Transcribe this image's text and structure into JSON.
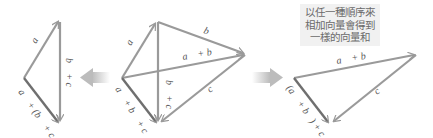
{
  "caption": {
    "lines": [
      "以任一種順序來",
      "相加向量會得到",
      "一樣的向量和"
    ]
  },
  "left_diagram": {
    "labels": {
      "a": "a⃗",
      "b_plus_c": "b⃗ + c⃗",
      "sum": "a⃗ + (b⃗ + c⃗)"
    }
  },
  "center_diagram": {
    "labels": {
      "a": "a⃗",
      "b": "b⃗",
      "a_plus_b": "a⃗ + b⃗",
      "b_plus_c": "b⃗ + c⃗",
      "c": "c⃗",
      "sum": "a⃗ + b⃗ + c⃗"
    }
  },
  "right_diagram": {
    "labels": {
      "a_plus_b": "a⃗ + b⃗",
      "c": "c⃗",
      "sum": "(a⃗ + b⃗) + c⃗"
    }
  },
  "arrows": {
    "left": "arrow-left",
    "right": "arrow-right"
  },
  "colors": {
    "vector_line": "#9a9a9a",
    "resultant_line": "#6f6f6f",
    "arrow_fill": "#c8c8c8",
    "caption_bg": "#f1f1f1",
    "caption_text": "#6a6a6a"
  }
}
